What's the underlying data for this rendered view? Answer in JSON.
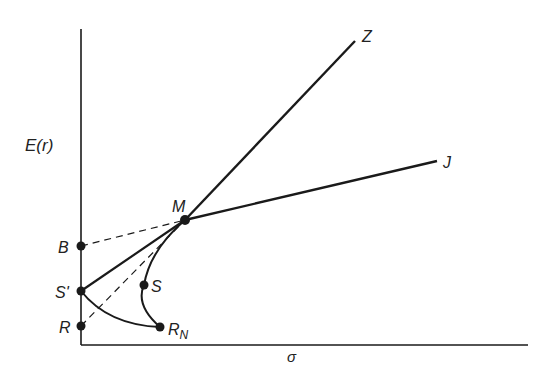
{
  "diagram": {
    "axis_labels": {
      "y": "E(r)",
      "x": "σ"
    },
    "points": {
      "M": "M",
      "B": "B",
      "S_prime": "S'",
      "R": "R",
      "S": "S",
      "R_N": "R",
      "R_N_sub": "N"
    },
    "line_ends": {
      "Z": "Z",
      "J": "J"
    },
    "colors": {
      "ink": "#1a1a1a",
      "background": "#ffffff"
    }
  }
}
